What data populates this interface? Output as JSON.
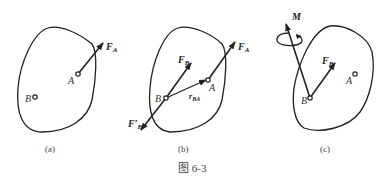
{
  "figure": {
    "caption": "图 6-3",
    "panels": [
      {
        "id": "a",
        "label": "(a)",
        "points": {
          "A": "A",
          "B": "B"
        },
        "forces": [
          {
            "name": "F",
            "sub": "A"
          }
        ]
      },
      {
        "id": "b",
        "label": "(b)",
        "points": {
          "A": "A",
          "B": "B"
        },
        "forces": [
          {
            "name": "F",
            "sub": "A"
          },
          {
            "name": "F",
            "sub": "B"
          },
          {
            "name": "F′",
            "sub": "B"
          }
        ],
        "vector": {
          "name": "r",
          "sub": "BA"
        }
      },
      {
        "id": "c",
        "label": "(c)",
        "points": {
          "A": "A",
          "B": "B"
        },
        "forces": [
          {
            "name": "F",
            "sub": "B"
          }
        ],
        "moment": "M"
      }
    ]
  },
  "colors": {
    "stroke": "#222222",
    "text": "#333333",
    "background": "#ffffff"
  }
}
